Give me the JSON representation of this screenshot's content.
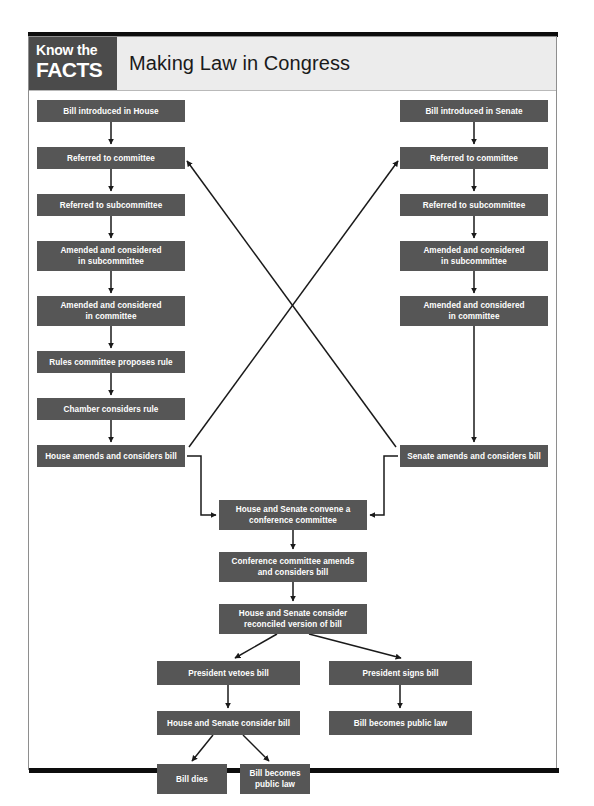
{
  "header": {
    "badge_line1": "Know the",
    "badge_line2": "FACTS",
    "title": "Making Law in Congress",
    "badge_color": "#4b4b4b",
    "bar_color": "#ececec"
  },
  "theme": {
    "node_fill": "#565656",
    "node_text": "#ffffff",
    "wire_color": "#1a1a1a",
    "frame_color": "#8e8e8e",
    "page_background": "#ffffff"
  },
  "diagram": {
    "type": "flowchart",
    "orientation": "top-to-bottom",
    "nodes": [
      {
        "id": "house_intro",
        "label": "Bill introduced in House",
        "x": 8,
        "y": 9,
        "w": 148,
        "h": 22
      },
      {
        "id": "house_comm",
        "label": "Referred to committee",
        "x": 8,
        "y": 56,
        "w": 148,
        "h": 22
      },
      {
        "id": "house_subcomm",
        "label": "Referred to subcommittee",
        "x": 8,
        "y": 103,
        "w": 148,
        "h": 22
      },
      {
        "id": "house_amend_sub",
        "label": "Amended and considered\nin subcommittee",
        "x": 8,
        "y": 150,
        "w": 148,
        "h": 30
      },
      {
        "id": "house_amend_comm",
        "label": "Amended and considered\nin committee",
        "x": 8,
        "y": 205,
        "w": 148,
        "h": 30
      },
      {
        "id": "house_rules",
        "label": "Rules committee proposes rule",
        "x": 8,
        "y": 260,
        "w": 148,
        "h": 22
      },
      {
        "id": "house_chamber",
        "label": "Chamber considers rule",
        "x": 8,
        "y": 307,
        "w": 148,
        "h": 22
      },
      {
        "id": "house_amends",
        "label": "House amends and considers bill",
        "x": 8,
        "y": 354,
        "w": 148,
        "h": 22
      },
      {
        "id": "senate_intro",
        "label": "Bill introduced in Senate",
        "x": 371,
        "y": 9,
        "w": 148,
        "h": 22
      },
      {
        "id": "senate_comm",
        "label": "Referred to committee",
        "x": 371,
        "y": 56,
        "w": 148,
        "h": 22
      },
      {
        "id": "senate_subcomm",
        "label": "Referred to subcommittee",
        "x": 371,
        "y": 103,
        "w": 148,
        "h": 22
      },
      {
        "id": "senate_amend_sub",
        "label": "Amended and considered\nin subcommittee",
        "x": 371,
        "y": 150,
        "w": 148,
        "h": 30
      },
      {
        "id": "senate_amend_comm",
        "label": "Amended and considered\nin committee",
        "x": 371,
        "y": 205,
        "w": 148,
        "h": 30
      },
      {
        "id": "senate_amends",
        "label": "Senate amends and considers bill",
        "x": 371,
        "y": 354,
        "w": 148,
        "h": 22
      },
      {
        "id": "conference_convene",
        "label": "House and Senate convene a\nconference committee",
        "x": 190,
        "y": 409,
        "w": 148,
        "h": 30
      },
      {
        "id": "conference_amends",
        "label": "Conference committee amends\nand considers bill",
        "x": 190,
        "y": 461,
        "w": 148,
        "h": 30
      },
      {
        "id": "reconciled",
        "label": "House and Senate consider\nreconciled version of bill",
        "x": 190,
        "y": 513,
        "w": 148,
        "h": 30
      },
      {
        "id": "veto",
        "label": "President vetoes bill",
        "x": 128,
        "y": 570,
        "w": 143,
        "h": 24
      },
      {
        "id": "signs",
        "label": "President signs bill",
        "x": 300,
        "y": 570,
        "w": 143,
        "h": 24
      },
      {
        "id": "reconsider",
        "label": "House and Senate consider bill",
        "x": 128,
        "y": 620,
        "w": 143,
        "h": 24
      },
      {
        "id": "public_law_b",
        "label": "Bill becomes public law",
        "x": 300,
        "y": 620,
        "w": 143,
        "h": 24
      },
      {
        "id": "bill_dies",
        "label": "Bill dies",
        "x": 128,
        "y": 673,
        "w": 70,
        "h": 30
      },
      {
        "id": "public_law_a",
        "label": "Bill becomes\npublic law",
        "x": 211,
        "y": 673,
        "w": 70,
        "h": 30
      }
    ],
    "edges": [
      {
        "from": "house_intro",
        "to": "house_comm",
        "style": "straight-arrow"
      },
      {
        "from": "house_comm",
        "to": "house_subcomm",
        "style": "straight-arrow"
      },
      {
        "from": "house_subcomm",
        "to": "house_amend_sub",
        "style": "straight-arrow"
      },
      {
        "from": "house_amend_sub",
        "to": "house_amend_comm",
        "style": "straight-arrow"
      },
      {
        "from": "house_amend_comm",
        "to": "house_rules",
        "style": "straight-arrow"
      },
      {
        "from": "house_rules",
        "to": "house_chamber",
        "style": "straight-arrow"
      },
      {
        "from": "house_chamber",
        "to": "house_amends",
        "style": "straight-arrow"
      },
      {
        "from": "senate_intro",
        "to": "senate_comm",
        "style": "straight-arrow"
      },
      {
        "from": "senate_comm",
        "to": "senate_subcomm",
        "style": "straight-arrow"
      },
      {
        "from": "senate_subcomm",
        "to": "senate_amend_sub",
        "style": "straight-arrow"
      },
      {
        "from": "senate_amend_sub",
        "to": "senate_amend_comm",
        "style": "straight-arrow"
      },
      {
        "from": "senate_amend_comm",
        "to": "senate_amends",
        "style": "long-straight-arrow"
      },
      {
        "from": "house_amends",
        "to": "senate_comm",
        "style": "diagonal-arrow"
      },
      {
        "from": "senate_amends",
        "to": "house_comm",
        "style": "diagonal-arrow"
      },
      {
        "from": "house_amends",
        "to": "conference_convene",
        "style": "elbow-arrow"
      },
      {
        "from": "senate_amends",
        "to": "conference_convene",
        "style": "elbow-arrow"
      },
      {
        "from": "conference_convene",
        "to": "conference_amends",
        "style": "straight-arrow"
      },
      {
        "from": "conference_amends",
        "to": "reconciled",
        "style": "straight-arrow"
      },
      {
        "from": "reconciled",
        "to": "veto",
        "style": "diagonal-arrow"
      },
      {
        "from": "reconciled",
        "to": "signs",
        "style": "diagonal-arrow"
      },
      {
        "from": "veto",
        "to": "reconsider",
        "style": "straight-arrow"
      },
      {
        "from": "signs",
        "to": "public_law_b",
        "style": "straight-arrow"
      },
      {
        "from": "reconsider",
        "to": "bill_dies",
        "style": "diagonal-arrow"
      },
      {
        "from": "reconsider",
        "to": "public_law_a",
        "style": "diagonal-arrow"
      }
    ]
  }
}
